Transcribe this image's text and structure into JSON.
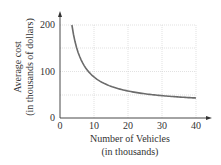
{
  "chart_data": {
    "type": "line",
    "title": "",
    "xlabel_line1": "Number of Vehicles",
    "xlabel_line2": "(in thousands)",
    "ylabel_line1": "Average cost",
    "ylabel_line2": "(in thousands of dollars)",
    "xticks": [
      "0",
      "10",
      "20",
      "30",
      "40"
    ],
    "yticks": [
      "0",
      "100",
      "200"
    ],
    "xlim": [
      0,
      40
    ],
    "ylim": [
      0,
      200
    ],
    "grid": true,
    "series": [
      {
        "name": "Average cost",
        "x": [
          3.5,
          5,
          7.5,
          10,
          15,
          20,
          25,
          30,
          35,
          40
        ],
        "y": [
          200,
          165,
          119,
          95,
          72,
          60,
          53,
          49,
          45.5,
          43
        ]
      }
    ],
    "colors": {
      "curve": "#6b6b6b",
      "grid": "#cfcfcf",
      "axis": "#333333"
    }
  }
}
